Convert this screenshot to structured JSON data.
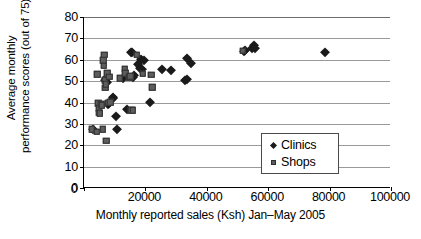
{
  "chart_data": {
    "type": "scatter",
    "title": "",
    "xlabel": "Monthly reported sales (Ksh) Jan–May 2005",
    "ylabel": "Average monthly performance scores (out of 75)",
    "ylabel_lines": [
      "Average monthly",
      "performance scores",
      "(out of 75)"
    ],
    "xlim": [
      0,
      100000
    ],
    "ylim": [
      0,
      80
    ],
    "xticks": [
      0,
      20000,
      40000,
      60000,
      80000,
      100000
    ],
    "xticklabels": [
      "0",
      "20000",
      "40000",
      "60000",
      "80000",
      "100000"
    ],
    "yticks": [
      0,
      10,
      20,
      30,
      40,
      50,
      60,
      70,
      80
    ],
    "yticklabels": [
      "0",
      "10",
      "20",
      "30",
      "40",
      "50",
      "60",
      "70",
      "80"
    ],
    "grid": "horizontal",
    "legend_position": "inside-lower-right",
    "series": [
      {
        "name": "Clinics",
        "marker": "diamond",
        "color": "#1a1a1a",
        "points": [
          [
            3000,
            27.7
          ],
          [
            7000,
            50.5
          ],
          [
            7200,
            51.5
          ],
          [
            7400,
            49.8
          ],
          [
            7700,
            39.5
          ],
          [
            8000,
            40.0
          ],
          [
            9300,
            42.5
          ],
          [
            9600,
            42.0
          ],
          [
            10400,
            33.7
          ],
          [
            10600,
            27.8
          ],
          [
            12700,
            51.3
          ],
          [
            13900,
            36.8
          ],
          [
            15300,
            63.8
          ],
          [
            15600,
            63.5
          ],
          [
            16000,
            51.9
          ],
          [
            16400,
            53.0
          ],
          [
            17700,
            57.8
          ],
          [
            18100,
            56.3
          ],
          [
            18500,
            60.4
          ],
          [
            19000,
            55.7
          ],
          [
            19400,
            59.9
          ],
          [
            21600,
            40.2
          ],
          [
            25300,
            55.8
          ],
          [
            28500,
            55.0
          ],
          [
            33000,
            50.5
          ],
          [
            33400,
            51.2
          ],
          [
            33600,
            60.9
          ],
          [
            35000,
            58.4
          ],
          [
            52000,
            64.2
          ],
          [
            52600,
            64.6
          ],
          [
            54800,
            65.5
          ],
          [
            55300,
            66.8
          ],
          [
            55600,
            65.3
          ],
          [
            78400,
            63.8
          ]
        ]
      },
      {
        "name": "Shops",
        "marker": "square",
        "color": "#5d5d5d",
        "points": [
          [
            2600,
            27.6
          ],
          [
            4100,
            26.2
          ],
          [
            4300,
            53.2
          ],
          [
            4600,
            39.6
          ],
          [
            4800,
            37.3
          ],
          [
            4900,
            35.2
          ],
          [
            5100,
            34.9
          ],
          [
            5600,
            39.2
          ],
          [
            5800,
            38.8
          ],
          [
            6100,
            27.5
          ],
          [
            6300,
            59.8
          ],
          [
            6500,
            57.2
          ],
          [
            6600,
            62.4
          ],
          [
            6800,
            50.4
          ],
          [
            6900,
            46.8
          ],
          [
            7100,
            48.6
          ],
          [
            7300,
            22.1
          ],
          [
            7600,
            53.8
          ],
          [
            7800,
            39.9
          ],
          [
            8300,
            52.0
          ],
          [
            8500,
            40.1
          ],
          [
            11600,
            51.3
          ],
          [
            13200,
            55.9
          ],
          [
            13400,
            53.7
          ],
          [
            14700,
            51.8
          ],
          [
            15100,
            52.2
          ],
          [
            15400,
            36.4
          ],
          [
            15800,
            36.3
          ],
          [
            17200,
            62.3
          ],
          [
            19200,
            53.4
          ],
          [
            21900,
            52.9
          ],
          [
            22200,
            47.2
          ],
          [
            51700,
            64.1
          ]
        ]
      }
    ]
  },
  "legend": {
    "items": [
      {
        "label": "Clinics",
        "marker": "diamond"
      },
      {
        "label": "Shops",
        "marker": "square"
      }
    ]
  }
}
